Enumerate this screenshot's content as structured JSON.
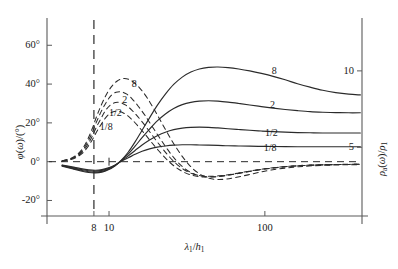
{
  "chart_data": {
    "type": "line",
    "title": "",
    "xlabel": "λ₁/h₁",
    "ylabel_left": "φ(ω)/(°)",
    "ylabel_right": "ρₐ(ω)/ρ₁",
    "xscale": "log",
    "xlim": [
      4,
      420
    ],
    "ylim_left": [
      -28,
      72
    ],
    "ylim_right": [
      0.5,
      13.2
    ],
    "grid": false,
    "legend_position": "inline-curve-labels",
    "xticks": [
      {
        "value": 8,
        "label": "8"
      },
      {
        "value": 10,
        "label": "10"
      },
      {
        "value": 100,
        "label": "100"
      }
    ],
    "yticks_left": [
      {
        "value": -20,
        "label": "-20°"
      },
      {
        "value": 0,
        "label": "0°"
      },
      {
        "value": 20,
        "label": "20°"
      },
      {
        "value": 40,
        "label": "40°"
      },
      {
        "value": 60,
        "label": "60°"
      }
    ],
    "yticks_right": [
      {
        "value": 5,
        "label": "5"
      },
      {
        "value": 10,
        "label": "10"
      }
    ],
    "annotations": [
      {
        "name": "vertical-reference-line",
        "x": 8,
        "style": "dashed"
      },
      {
        "name": "zero-phase-line",
        "y": 0,
        "style": "dashed"
      }
    ],
    "series": [
      {
        "name": "phase-8",
        "label": "8",
        "style": "dashed",
        "axis": "left",
        "label_x": 14.5,
        "label_y": 40,
        "points": [
          [
            5.0,
            0.5
          ],
          [
            5.6,
            1.5
          ],
          [
            6.2,
            3.5
          ],
          [
            6.8,
            7.0
          ],
          [
            7.3,
            11.5
          ],
          [
            7.8,
            17.0
          ],
          [
            8.3,
            23.0
          ],
          [
            8.9,
            29.0
          ],
          [
            9.6,
            34.5
          ],
          [
            10.4,
            38.8
          ],
          [
            11.3,
            41.6
          ],
          [
            12.3,
            42.8
          ],
          [
            13.4,
            42.4
          ],
          [
            14.6,
            40.6
          ],
          [
            16.0,
            37.3
          ],
          [
            17.6,
            32.8
          ],
          [
            19.4,
            27.2
          ],
          [
            21.5,
            20.8
          ],
          [
            24.0,
            14.0
          ],
          [
            27.0,
            7.2
          ],
          [
            30.5,
            1.2
          ],
          [
            34.5,
            -3.6
          ],
          [
            39.0,
            -6.8
          ],
          [
            44.0,
            -8.6
          ],
          [
            50.0,
            -9.2
          ],
          [
            57.0,
            -8.9
          ],
          [
            66.0,
            -8.0
          ],
          [
            78.0,
            -6.8
          ],
          [
            92.0,
            -5.5
          ],
          [
            110.0,
            -4.3
          ],
          [
            135.0,
            -3.3
          ],
          [
            165.0,
            -2.6
          ],
          [
            205.0,
            -2.1
          ],
          [
            260.0,
            -1.8
          ],
          [
            330.0,
            -1.6
          ],
          [
            410.0,
            -1.5
          ]
        ]
      },
      {
        "name": "phase-2",
        "label": "2",
        "style": "dashed",
        "axis": "left",
        "label_x": 12.6,
        "label_y": 32,
        "points": [
          [
            5.0,
            0.4
          ],
          [
            5.6,
            1.3
          ],
          [
            6.2,
            3.1
          ],
          [
            6.8,
            6.2
          ],
          [
            7.3,
            10.2
          ],
          [
            7.8,
            15.0
          ],
          [
            8.3,
            20.4
          ],
          [
            8.9,
            25.8
          ],
          [
            9.6,
            30.6
          ],
          [
            10.3,
            34.0
          ],
          [
            11.1,
            35.8
          ],
          [
            12.0,
            36.0
          ],
          [
            13.0,
            34.8
          ],
          [
            14.1,
            32.3
          ],
          [
            15.4,
            28.6
          ],
          [
            17.0,
            23.9
          ],
          [
            18.8,
            18.5
          ],
          [
            21.0,
            12.6
          ],
          [
            23.6,
            6.6
          ],
          [
            26.6,
            1.2
          ],
          [
            30.0,
            -3.0
          ],
          [
            34.0,
            -5.8
          ],
          [
            38.6,
            -7.3
          ],
          [
            44.0,
            -7.8
          ],
          [
            50.5,
            -7.6
          ],
          [
            58.5,
            -6.9
          ],
          [
            68.5,
            -6.0
          ],
          [
            81.0,
            -4.9
          ],
          [
            97.0,
            -3.9
          ],
          [
            117.0,
            -3.1
          ],
          [
            143.0,
            -2.4
          ],
          [
            176.0,
            -2.0
          ],
          [
            220.0,
            -1.7
          ],
          [
            280.0,
            -1.5
          ],
          [
            350.0,
            -1.4
          ],
          [
            410.0,
            -1.35
          ]
        ]
      },
      {
        "name": "phase-half",
        "label": "1/2",
        "style": "dashed",
        "axis": "left",
        "label_x": 11.0,
        "label_y": 25,
        "points": [
          [
            5.0,
            0.3
          ],
          [
            5.6,
            1.1
          ],
          [
            6.2,
            2.7
          ],
          [
            6.8,
            5.4
          ],
          [
            7.3,
            8.9
          ],
          [
            7.8,
            13.1
          ],
          [
            8.3,
            17.8
          ],
          [
            8.9,
            22.4
          ],
          [
            9.5,
            26.4
          ],
          [
            10.2,
            29.2
          ],
          [
            11.0,
            30.5
          ],
          [
            11.9,
            30.4
          ],
          [
            12.9,
            29.0
          ],
          [
            14.0,
            26.6
          ],
          [
            15.3,
            23.2
          ],
          [
            16.9,
            19.0
          ],
          [
            18.7,
            14.2
          ],
          [
            20.9,
            9.1
          ],
          [
            23.5,
            4.0
          ],
          [
            26.5,
            -0.5
          ],
          [
            30.0,
            -3.9
          ],
          [
            34.0,
            -6.1
          ],
          [
            38.6,
            -7.2
          ],
          [
            44.0,
            -7.5
          ],
          [
            50.5,
            -7.3
          ],
          [
            58.5,
            -6.7
          ],
          [
            68.5,
            -5.8
          ],
          [
            81.0,
            -4.8
          ],
          [
            97.0,
            -3.8
          ],
          [
            117.0,
            -3.0
          ],
          [
            143.0,
            -2.4
          ],
          [
            176.0,
            -1.9
          ],
          [
            220.0,
            -1.6
          ],
          [
            280.0,
            -1.45
          ],
          [
            350.0,
            -1.35
          ],
          [
            410.0,
            -1.3
          ]
        ]
      },
      {
        "name": "phase-eighth",
        "label": "1/8",
        "style": "dashed",
        "axis": "left",
        "label_x": 9.6,
        "label_y": 18,
        "points": [
          [
            5.0,
            0.25
          ],
          [
            5.6,
            0.95
          ],
          [
            6.2,
            2.3
          ],
          [
            6.8,
            4.6
          ],
          [
            7.3,
            7.6
          ],
          [
            7.8,
            11.2
          ],
          [
            8.3,
            15.2
          ],
          [
            8.9,
            19.2
          ],
          [
            9.5,
            22.6
          ],
          [
            10.2,
            25.0
          ],
          [
            11.0,
            26.0
          ],
          [
            11.9,
            25.7
          ],
          [
            12.9,
            24.2
          ],
          [
            14.0,
            21.8
          ],
          [
            15.3,
            18.5
          ],
          [
            16.9,
            14.5
          ],
          [
            18.7,
            10.1
          ],
          [
            20.9,
            5.5
          ],
          [
            23.5,
            1.1
          ],
          [
            26.5,
            -2.6
          ],
          [
            30.0,
            -5.3
          ],
          [
            34.0,
            -7.0
          ],
          [
            38.6,
            -7.8
          ],
          [
            44.0,
            -7.9
          ],
          [
            50.5,
            -7.6
          ],
          [
            58.5,
            -6.9
          ],
          [
            68.5,
            -5.9
          ],
          [
            81.0,
            -4.9
          ],
          [
            97.0,
            -3.9
          ],
          [
            117.0,
            -3.1
          ],
          [
            143.0,
            -2.4
          ],
          [
            176.0,
            -2.0
          ],
          [
            220.0,
            -1.7
          ],
          [
            280.0,
            -1.5
          ],
          [
            350.0,
            -1.4
          ],
          [
            410.0,
            -1.35
          ]
        ]
      },
      {
        "name": "resistivity-8",
        "label": "8",
        "style": "solid",
        "axis": "right",
        "label_x": 115.0,
        "label_y": 47,
        "points": [
          [
            5.0,
            -2.3
          ],
          [
            5.8,
            -3.6
          ],
          [
            6.6,
            -4.8
          ],
          [
            7.4,
            -5.6
          ],
          [
            8.2,
            -5.8
          ],
          [
            9.0,
            -5.4
          ],
          [
            9.9,
            -4.2
          ],
          [
            10.9,
            -2.2
          ],
          [
            12.0,
            0.8
          ],
          [
            13.3,
            5.0
          ],
          [
            14.7,
            10.2
          ],
          [
            16.3,
            16.2
          ],
          [
            18.2,
            22.6
          ],
          [
            20.4,
            29.0
          ],
          [
            23.0,
            34.8
          ],
          [
            26.0,
            39.8
          ],
          [
            29.5,
            43.6
          ],
          [
            33.5,
            46.2
          ],
          [
            38.0,
            47.8
          ],
          [
            43.5,
            48.6
          ],
          [
            50.0,
            48.8
          ],
          [
            58.0,
            48.5
          ],
          [
            68.0,
            47.8
          ],
          [
            80.0,
            46.8
          ],
          [
            95.0,
            45.5
          ],
          [
            113.0,
            44.0
          ],
          [
            135.0,
            42.2
          ],
          [
            162.0,
            40.2
          ],
          [
            195.0,
            38.4
          ],
          [
            235.0,
            36.8
          ],
          [
            285.0,
            35.6
          ],
          [
            345.0,
            34.8
          ],
          [
            410.0,
            34.4
          ]
        ]
      },
      {
        "name": "resistivity-2",
        "label": "2",
        "style": "solid",
        "axis": "right",
        "label_x": 112.0,
        "label_y": 29,
        "points": [
          [
            5.0,
            -2.1
          ],
          [
            5.8,
            -3.3
          ],
          [
            6.6,
            -4.4
          ],
          [
            7.4,
            -5.2
          ],
          [
            8.2,
            -5.4
          ],
          [
            9.0,
            -5.0
          ],
          [
            9.9,
            -3.9
          ],
          [
            10.9,
            -2.1
          ],
          [
            12.0,
            0.6
          ],
          [
            13.3,
            4.0
          ],
          [
            14.7,
            8.0
          ],
          [
            16.3,
            12.4
          ],
          [
            18.2,
            16.8
          ],
          [
            20.4,
            21.0
          ],
          [
            23.0,
            24.6
          ],
          [
            26.0,
            27.4
          ],
          [
            29.5,
            29.4
          ],
          [
            33.5,
            30.6
          ],
          [
            38.0,
            31.2
          ],
          [
            43.5,
            31.4
          ],
          [
            50.0,
            31.2
          ],
          [
            58.0,
            30.7
          ],
          [
            68.0,
            30.0
          ],
          [
            80.0,
            29.2
          ],
          [
            95.0,
            28.4
          ],
          [
            113.0,
            27.6
          ],
          [
            135.0,
            26.9
          ],
          [
            162.0,
            26.3
          ],
          [
            195.0,
            25.8
          ],
          [
            235.0,
            25.5
          ],
          [
            285.0,
            25.3
          ],
          [
            345.0,
            25.2
          ],
          [
            410.0,
            25.2
          ]
        ]
      },
      {
        "name": "resistivity-half",
        "label": "1/2",
        "style": "solid",
        "axis": "right",
        "label_x": 110.0,
        "label_y": 15,
        "points": [
          [
            5.0,
            -1.9
          ],
          [
            5.8,
            -3.0
          ],
          [
            6.6,
            -4.0
          ],
          [
            7.4,
            -4.7
          ],
          [
            8.2,
            -4.9
          ],
          [
            9.0,
            -4.5
          ],
          [
            9.9,
            -3.5
          ],
          [
            10.9,
            -1.9
          ],
          [
            12.0,
            0.4
          ],
          [
            13.3,
            3.0
          ],
          [
            14.7,
            5.8
          ],
          [
            16.3,
            8.6
          ],
          [
            18.2,
            11.2
          ],
          [
            20.4,
            13.4
          ],
          [
            23.0,
            15.2
          ],
          [
            26.0,
            16.5
          ],
          [
            29.5,
            17.3
          ],
          [
            33.5,
            17.7
          ],
          [
            38.0,
            17.8
          ],
          [
            43.5,
            17.7
          ],
          [
            50.0,
            17.4
          ],
          [
            58.0,
            17.0
          ],
          [
            68.0,
            16.6
          ],
          [
            80.0,
            16.2
          ],
          [
            95.0,
            15.8
          ],
          [
            113.0,
            15.5
          ],
          [
            135.0,
            15.2
          ],
          [
            162.0,
            15.0
          ],
          [
            195.0,
            14.9
          ],
          [
            235.0,
            14.8
          ],
          [
            285.0,
            14.8
          ],
          [
            345.0,
            14.8
          ],
          [
            410.0,
            14.8
          ]
        ]
      },
      {
        "name": "resistivity-eighth",
        "label": "1/8",
        "style": "solid",
        "axis": "right",
        "label_x": 108.0,
        "label_y": 7,
        "points": [
          [
            5.0,
            -1.7
          ],
          [
            5.8,
            -2.7
          ],
          [
            6.6,
            -3.6
          ],
          [
            7.4,
            -4.2
          ],
          [
            8.2,
            -4.4
          ],
          [
            9.0,
            -4.1
          ],
          [
            9.9,
            -3.2
          ],
          [
            10.9,
            -1.8
          ],
          [
            12.0,
            0.2
          ],
          [
            13.3,
            2.0
          ],
          [
            14.7,
            3.8
          ],
          [
            16.3,
            5.4
          ],
          [
            18.2,
            6.6
          ],
          [
            20.4,
            7.5
          ],
          [
            23.0,
            8.1
          ],
          [
            26.0,
            8.5
          ],
          [
            29.5,
            8.7
          ],
          [
            33.5,
            8.7
          ],
          [
            38.0,
            8.6
          ],
          [
            43.5,
            8.5
          ],
          [
            50.0,
            8.4
          ],
          [
            58.0,
            8.2
          ],
          [
            68.0,
            8.1
          ],
          [
            80.0,
            8.0
          ],
          [
            95.0,
            7.9
          ],
          [
            113.0,
            7.8
          ],
          [
            135.0,
            7.8
          ],
          [
            162.0,
            7.7
          ],
          [
            195.0,
            7.7
          ],
          [
            235.0,
            7.7
          ],
          [
            285.0,
            7.7
          ],
          [
            345.0,
            7.7
          ],
          [
            410.0,
            7.7
          ]
        ]
      }
    ]
  },
  "style": {
    "line_color": "#2b2b2b",
    "axis_color": "#5a5a5a",
    "background": "#ffffff"
  }
}
